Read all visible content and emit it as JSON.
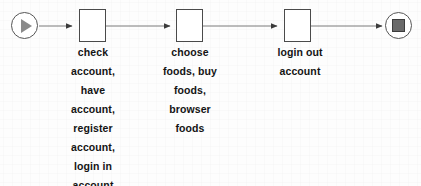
{
  "diagram": {
    "type": "activity-flow",
    "orientation": "left-to-right",
    "background_color": "#fdfdfd",
    "line_color": "#6e6e6e",
    "node_border_color": "#4a4a4a",
    "text_color": "#141414",
    "nodes": [
      {
        "id": "start",
        "kind": "start-node",
        "icon": "play-triangle-icon",
        "label": "",
        "shape": "circle"
      },
      {
        "id": "task-1",
        "kind": "task-box",
        "shape": "rectangle",
        "label": "check\naccount,\nhave\naccount,\nregister\naccount,\nlogin in\naccount"
      },
      {
        "id": "task-2",
        "kind": "task-box",
        "shape": "rectangle",
        "label": "choose\nfoods, buy\nfoods,\nbrowser\nfoods"
      },
      {
        "id": "task-3",
        "kind": "task-box",
        "shape": "rectangle",
        "label": "login out\naccount"
      },
      {
        "id": "end",
        "kind": "end-node",
        "icon": "stop-square-icon",
        "label": "",
        "shape": "circle"
      }
    ],
    "edges": [
      {
        "id": "edge-1",
        "from": "start",
        "to": "task-1",
        "arrowhead": "solid-triangle"
      },
      {
        "id": "edge-2",
        "from": "task-1",
        "to": "task-2",
        "arrowhead": "solid-triangle"
      },
      {
        "id": "edge-3",
        "from": "task-2",
        "to": "task-3",
        "arrowhead": "solid-triangle"
      },
      {
        "id": "edge-4",
        "from": "task-3",
        "to": "end",
        "arrowhead": "solid-triangle"
      }
    ]
  }
}
